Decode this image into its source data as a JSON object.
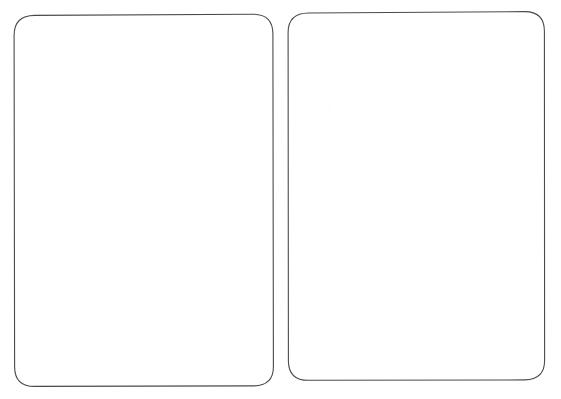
{
  "scene": {
    "title": "Two blank rounded cards",
    "background_color": "#ffffff",
    "width": 561,
    "height": 399,
    "stroke_color": "#4a4a4a",
    "stroke_color_light": "#6e6e6e",
    "stroke_width": 1.1,
    "card_fill": "#ffffff"
  },
  "cards": [
    {
      "name": "left-card",
      "label": "",
      "x": 14,
      "y": 15,
      "width": 259,
      "height": 371,
      "corner_radius": 20,
      "rotation": -0.3,
      "content": ""
    },
    {
      "name": "right-card",
      "label": "",
      "x": 288,
      "y": 12,
      "width": 256,
      "height": 368,
      "corner_radius": 20,
      "rotation": 0.4,
      "content": ""
    }
  ],
  "artifacts": [
    {
      "name": "scan-smudge",
      "x": 329,
      "y": 103,
      "color": "#fcfcfc"
    }
  ],
  "gap": {
    "between_cards_px": 15
  }
}
